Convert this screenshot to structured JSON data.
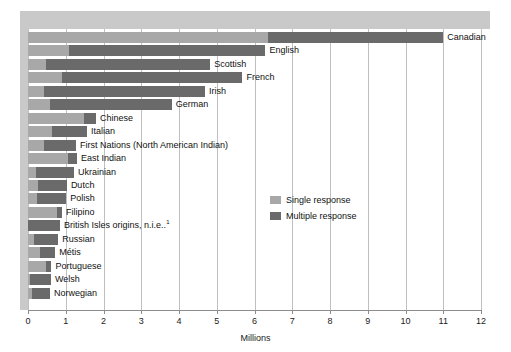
{
  "chart_data": {
    "type": "bar",
    "orientation": "horizontal",
    "stacked": true,
    "title": "",
    "xlabel": "Millions",
    "ylabel": "",
    "xlim": [
      0,
      12
    ],
    "xticks": [
      "0",
      "1",
      "2",
      "3",
      "4",
      "5",
      "6",
      "7",
      "8",
      "9",
      "10",
      "11",
      "12"
    ],
    "grid": "vertical",
    "legend_position": "middle-right",
    "categories": [
      "Canadian",
      "English",
      "Scottish",
      "French",
      "Irish",
      "German",
      "Chinese",
      "Italian",
      "First Nations (North American Indian)",
      "East Indian",
      "Ukrainian",
      "Dutch",
      "Polish",
      "Filipino",
      "British Isles origins, n.i.e.",
      "Russian",
      "Métis",
      "Portuguese",
      "Welsh",
      "Norwegian"
    ],
    "series": [
      {
        "name": "Single response",
        "color": "#a8a8a8",
        "values": [
          6.35,
          1.08,
          0.48,
          0.91,
          0.42,
          0.58,
          1.48,
          0.64,
          0.42,
          1.06,
          0.21,
          0.27,
          0.24,
          0.77,
          0.0,
          0.16,
          0.32,
          0.48,
          0.04,
          0.1
        ]
      },
      {
        "name": "Multiple response",
        "color": "#6a6a6a",
        "values": [
          4.65,
          5.21,
          4.35,
          4.77,
          4.27,
          3.23,
          0.32,
          0.92,
          0.85,
          0.24,
          1.01,
          0.76,
          0.77,
          0.13,
          0.85,
          0.64,
          0.4,
          0.14,
          0.57,
          0.48
        ]
      }
    ],
    "totals": [
      11.0,
      6.29,
      4.83,
      5.68,
      4.69,
      3.81,
      1.8,
      1.56,
      1.27,
      1.3,
      1.22,
      1.03,
      1.01,
      0.9,
      0.85,
      0.8,
      0.72,
      0.62,
      0.61,
      0.58
    ],
    "footnote_marker": "1"
  },
  "legend": {
    "items": [
      {
        "label": "Single response",
        "color": "#a8a8a8"
      },
      {
        "label": "Multiple response",
        "color": "#6a6a6a"
      }
    ]
  },
  "axis": {
    "x_title": "Millions"
  },
  "colors": {
    "single": "#a8a8a8",
    "multiple": "#6a6a6a",
    "grid": "#bfbfbf",
    "banner": "#c9c9c9",
    "axis": "#8d8d8d",
    "text": "#111111"
  }
}
